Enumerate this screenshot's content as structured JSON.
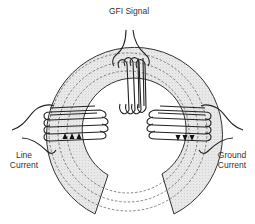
{
  "diagram": {
    "labels": {
      "gfi_signal": "GFI Signal",
      "line_current_1": "Line",
      "line_current_2": "Current",
      "ground_current_1": "Ground",
      "ground_current_2": "Current"
    },
    "components": [
      {
        "name": "toroidal-core",
        "shape": "split ring, open at bottom"
      },
      {
        "name": "gfi-signal-coil",
        "position": "top",
        "turns": 4
      },
      {
        "name": "line-current-coil",
        "position": "left",
        "turns": 4,
        "arrow_direction": "up",
        "arrow_count": 3
      },
      {
        "name": "ground-current-coil",
        "position": "right",
        "turns": 4,
        "arrow_direction": "down",
        "arrow_count": 3
      }
    ],
    "flux_lines": 3,
    "colors": {
      "core_fill": "#e6e6e6",
      "stroke": "#222222",
      "flux_dash": "#555555",
      "text": "#333333"
    }
  }
}
